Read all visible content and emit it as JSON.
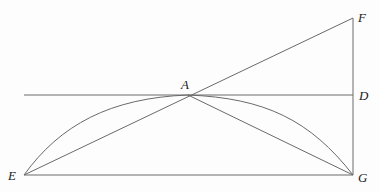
{
  "diagram": {
    "type": "geometric-figure",
    "points": {
      "A": {
        "label": "A",
        "x": 188,
        "y": 95
      },
      "D": {
        "label": "D",
        "x": 353,
        "y": 95
      },
      "E": {
        "label": "E",
        "x": 24,
        "y": 175
      },
      "F": {
        "label": "F",
        "x": 353,
        "y": 18
      },
      "G": {
        "label": "G",
        "x": 353,
        "y": 175
      }
    },
    "labels": {
      "A": "A",
      "D": "D",
      "E": "E",
      "F": "F",
      "G": "G"
    },
    "segments": [
      {
        "from": "E",
        "to": "F",
        "name": "line-EF"
      },
      {
        "from": "A",
        "to": "G",
        "name": "line-AG"
      },
      {
        "from": "E",
        "to": "G",
        "name": "line-EG"
      },
      {
        "from": "F",
        "to": "G",
        "name": "line-FG"
      },
      {
        "from": "A",
        "to": "D",
        "name": "line-AD"
      }
    ],
    "curves": [
      {
        "from": "E",
        "to": "A",
        "name": "arc-EA",
        "bulge": "upward"
      },
      {
        "from": "A",
        "to": "G",
        "name": "arc-AG",
        "bulge": "upward"
      }
    ],
    "colors": {
      "line": "#6a6a6a",
      "label": "#1a1a1a",
      "background": "#fdfdfd"
    }
  }
}
